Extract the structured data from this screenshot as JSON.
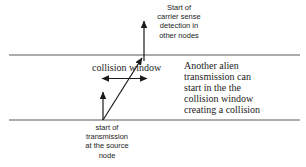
{
  "diagram": {
    "labels": {
      "carrier_sense": "Start of\ncarrier sense\ndetection in\nother nodes",
      "collision_window": "collision window",
      "alien_transmission": "Another alien\ntransmission can\nstart in the the\ncollision window\ncreating a collision",
      "source_transmission": "start of\ntransmission\nat the source\nnode"
    },
    "colors": {
      "background": "#ffffff",
      "line": "#909090",
      "arrow": "#1b1b1b",
      "text": "#1c1c1c"
    }
  }
}
